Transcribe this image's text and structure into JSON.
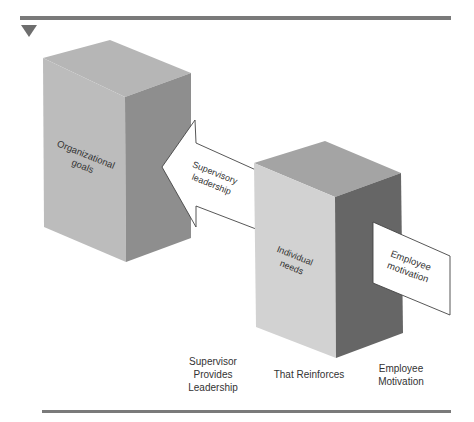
{
  "diagram": {
    "colors": {
      "rule": "#7a7a7a",
      "left_box_top": "#b6b6b6",
      "left_box_front": "#bcbcbc",
      "left_box_side": "#8e8e8e",
      "right_box_top": "#a4a4a4",
      "right_box_front": "#d2d2d2",
      "right_box_side": "#666666",
      "card_fill": "#ffffff"
    },
    "boxes": [
      {
        "id": "organizational-goals",
        "label_line1": "Organizational",
        "label_line2": "goals"
      },
      {
        "id": "individual-needs",
        "label_line1": "Individual",
        "label_line2": "needs"
      }
    ],
    "arrow": {
      "label_line1": "Supervisory",
      "label_line2": "leadership"
    },
    "card": {
      "label_line1": "Employee",
      "label_line2": "motivation"
    },
    "captions": [
      {
        "text": "Supervisor\nProvides\nLeadership"
      },
      {
        "text": "That Reinforces"
      },
      {
        "text": "Employee\nMotivation"
      }
    ]
  }
}
